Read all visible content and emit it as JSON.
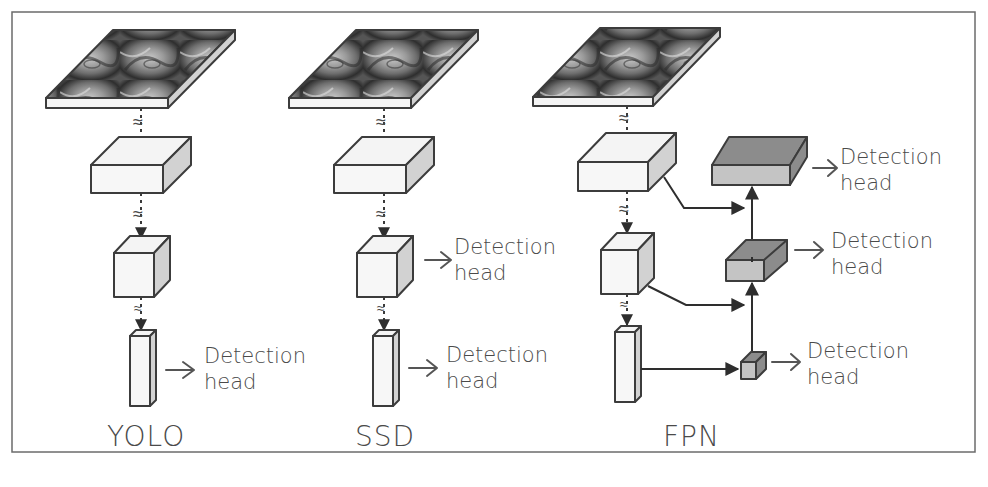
{
  "figure": {
    "frame": {
      "x": 12,
      "y": 12,
      "width": 963,
      "height": 440,
      "stroke": "#6b6b6b"
    },
    "colors": {
      "plain_face": "#f4f4f4",
      "plain_side": "#d2d2d2",
      "pyramid_front": "#c4c4c4",
      "pyramid_top": "#8c8c8c",
      "line": "#333333",
      "text": "#4a4a4a"
    },
    "columns": [
      {
        "id": "yolo",
        "label": "YOLO",
        "input_image": "rose-photo",
        "stages": [
          "wide-feature-map",
          "cube-feature-map",
          "narrow-feature-map"
        ],
        "detection_heads": [
          {
            "line1": "Detection",
            "line2": "head",
            "attached_to": "narrow-feature-map"
          }
        ]
      },
      {
        "id": "ssd",
        "label": "SSD",
        "input_image": "rose-photo",
        "stages": [
          "wide-feature-map",
          "cube-feature-map",
          "narrow-feature-map"
        ],
        "detection_heads": [
          {
            "line1": "Detection",
            "line2": "head",
            "attached_to": "cube-feature-map"
          },
          {
            "line1": "Detection",
            "line2": "head",
            "attached_to": "narrow-feature-map"
          }
        ]
      },
      {
        "id": "fpn",
        "label": "FPN",
        "input_image": "rose-photo",
        "stages": [
          "wide-feature-map",
          "cube-feature-map",
          "narrow-feature-map"
        ],
        "pyramid": [
          "top-merged-map",
          "middle-merged-map",
          "small-merged-map"
        ],
        "detection_heads": [
          {
            "line1": "Detection",
            "line2": "head",
            "attached_to": "top-merged-map"
          },
          {
            "line1": "Detection",
            "line2": "head",
            "attached_to": "middle-merged-map"
          },
          {
            "line1": "Detection",
            "line2": "head",
            "attached_to": "small-merged-map"
          }
        ]
      }
    ],
    "symbols": {
      "downsample": "≈"
    }
  }
}
